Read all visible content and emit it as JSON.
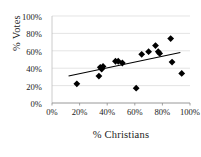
{
  "chart_data": {
    "type": "scatter",
    "title": "",
    "xlabel": "% Christians",
    "ylabel": "% Votes",
    "xlim": [
      0,
      100
    ],
    "ylim": [
      0,
      100
    ],
    "xticks": [
      "0%",
      "20%",
      "40%",
      "60%",
      "80%",
      "100%"
    ],
    "yticks": [
      "0%",
      "20%",
      "40%",
      "60%",
      "80%",
      "100%"
    ],
    "xtick_values": [
      0,
      20,
      40,
      60,
      80,
      100
    ],
    "ytick_values": [
      0,
      20,
      40,
      60,
      80,
      100
    ],
    "grid": "horizontal",
    "marker": "diamond",
    "marker_color": "#000000",
    "points": [
      {
        "x": 18,
        "y": 22
      },
      {
        "x": 34,
        "y": 31
      },
      {
        "x": 35,
        "y": 41
      },
      {
        "x": 36,
        "y": 39
      },
      {
        "x": 37,
        "y": 42
      },
      {
        "x": 46,
        "y": 48
      },
      {
        "x": 48,
        "y": 48
      },
      {
        "x": 51,
        "y": 46
      },
      {
        "x": 61,
        "y": 17
      },
      {
        "x": 65,
        "y": 56
      },
      {
        "x": 70,
        "y": 59
      },
      {
        "x": 75,
        "y": 66
      },
      {
        "x": 77,
        "y": 59
      },
      {
        "x": 78,
        "y": 57
      },
      {
        "x": 86,
        "y": 74
      },
      {
        "x": 87,
        "y": 47
      },
      {
        "x": 94,
        "y": 34
      }
    ],
    "trendline": {
      "visible": true,
      "color": "#000000",
      "x_start": 12,
      "y_start": 31,
      "x_end": 93,
      "y_end": 58
    },
    "series_name": "% Votes vs % Christians"
  }
}
